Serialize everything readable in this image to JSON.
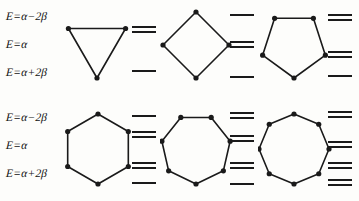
{
  "figure": {
    "background_color": "#fdfdfb",
    "ink_color": "#1a1a1a",
    "width": 359,
    "height": 201
  },
  "axis": {
    "labels": {
      "high": "E=α−2β",
      "mid": "E=α",
      "low": "E=α+2β"
    },
    "label_list": [
      "E=α−2β",
      "E=α",
      "E=α+2β"
    ]
  },
  "rows": [
    {
      "row_name": "top-row",
      "cells": [
        {
          "name": "cyclopropenyl",
          "sides": 3,
          "orientation": "vertex-down",
          "vertices": 3,
          "levels": [
            {
              "y": 28,
              "degeneracy": 2
            },
            {
              "y": 70,
              "degeneracy": 1
            }
          ]
        },
        {
          "name": "cyclobutadiene",
          "sides": 4,
          "orientation": "vertex-down",
          "vertices": 4,
          "levels": [
            {
              "y": 14,
              "degeneracy": 1
            },
            {
              "y": 43,
              "degeneracy": 2
            },
            {
              "y": 76,
              "degeneracy": 1
            }
          ]
        },
        {
          "name": "cyclopentadienyl",
          "sides": 5,
          "orientation": "vertex-down",
          "vertices": 5,
          "levels": [
            {
              "y": 16,
              "degeneracy": 2
            },
            {
              "y": 53,
              "degeneracy": 2
            },
            {
              "y": 75,
              "degeneracy": 1
            }
          ]
        }
      ]
    },
    {
      "row_name": "bottom-row",
      "cells": [
        {
          "name": "benzene",
          "sides": 6,
          "orientation": "vertex-down",
          "vertices": 6,
          "levels": [
            {
              "y": 14,
              "degeneracy": 1
            },
            {
              "y": 32,
              "degeneracy": 2
            },
            {
              "y": 63,
              "degeneracy": 2
            },
            {
              "y": 81,
              "degeneracy": 1
            }
          ]
        },
        {
          "name": "cycloheptatrienyl",
          "sides": 7,
          "orientation": "vertex-down",
          "vertices": 7,
          "levels": [
            {
              "y": 13,
              "degeneracy": 2
            },
            {
              "y": 36,
              "degeneracy": 2
            },
            {
              "y": 63,
              "degeneracy": 2
            },
            {
              "y": 82,
              "degeneracy": 1
            }
          ]
        },
        {
          "name": "cyclooctatetraene",
          "sides": 8,
          "orientation": "vertex-down",
          "vertices": 8,
          "levels": [
            {
              "y": 12,
              "degeneracy": 2
            },
            {
              "y": 42,
              "degeneracy": 2
            },
            {
              "y": 63,
              "degeneracy": 2
            },
            {
              "y": 80,
              "degeneracy": 2
            }
          ]
        }
      ]
    }
  ]
}
